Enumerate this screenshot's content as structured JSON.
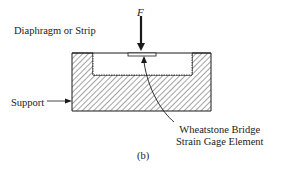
{
  "figure": {
    "caption": "(b)",
    "force_label": "F",
    "labels": {
      "diaphragm": "Diaphragm or Strip",
      "support": "Support",
      "gage_line1": "Wheatstone Bridge",
      "gage_line2": "Strain Gage Element"
    },
    "colors": {
      "ink": "#1a1a1a",
      "background": "#ffffff"
    }
  }
}
